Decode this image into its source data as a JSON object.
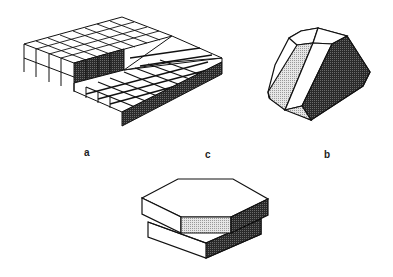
{
  "figure": {
    "panels": [
      {
        "id": "a",
        "label": "a",
        "description": "Stepped crystal surface of cubic blocks with a terrace step"
      },
      {
        "id": "b",
        "label": "b",
        "description": "Faceted polyhedral crystal with light, white and dark shaded faces"
      },
      {
        "id": "c",
        "label": "c",
        "description": "Two stacked hexagonal plates offset by a step"
      }
    ],
    "colors": {
      "background": "#ffffff",
      "line": "#111111",
      "dark_face": "#3a3a3a",
      "light_face": "#d4d4d4",
      "white_face": "#ffffff"
    }
  }
}
